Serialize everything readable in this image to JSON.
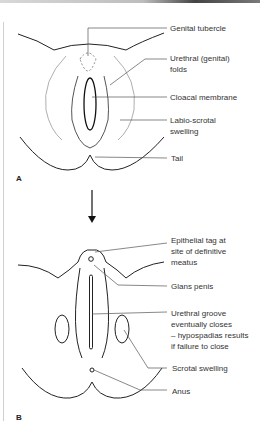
{
  "figure": {
    "panel_a": {
      "letter": "A",
      "labels": {
        "genital_tubercle": "Genital tubercle",
        "urethral_folds_1": "Urethral (genital)",
        "urethral_folds_2": "folds",
        "cloacal_membrane": "Cloacal membrane",
        "labio_scrotal_1": "Labio-scrotal",
        "labio_scrotal_2": "swelling",
        "tail": "Tail"
      }
    },
    "arrow": "down-arrow",
    "panel_b": {
      "letter": "B",
      "labels": {
        "epithelial_1": "Epithelial tag at",
        "epithelial_2": "site of definitive",
        "epithelial_3": "meatus",
        "glans_penis": "Glans penis",
        "groove_1": "Urethral groove",
        "groove_2": "eventually closes",
        "groove_3": "– hypospadias results",
        "groove_4": "if failure to close",
        "scrotal_swelling": "Scrotal swelling",
        "anus": "Anus"
      }
    },
    "colors": {
      "line": "#222222",
      "leader": "#555555",
      "text": "#333333"
    }
  }
}
